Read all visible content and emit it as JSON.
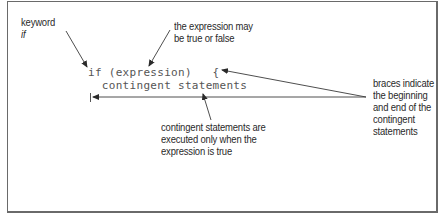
{
  "diagram": {
    "annotations": {
      "keyword": {
        "line1": "keyword",
        "line2": "if"
      },
      "expression": {
        "line1": "the expression may",
        "line2": "be true or false"
      },
      "braces": {
        "line1": "braces indicate",
        "line2": "the beginning",
        "line3": "and end of the",
        "line4": "contingent",
        "line5": "statements"
      },
      "contingent": {
        "line1": "contingent statements are",
        "line2": "executed only when the",
        "line3": "expression is true"
      }
    },
    "code": {
      "line1": "if (expression)   {",
      "line2": "  contingent statements",
      "closing_brace": "}"
    },
    "colors": {
      "text": "#2a2a2a",
      "code": "#555555",
      "arrow": "#3a3a3a",
      "border": "#6a6a6a",
      "background": "#ffffff"
    }
  }
}
